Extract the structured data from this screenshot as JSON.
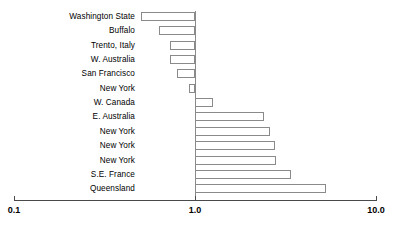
{
  "chart_data": {
    "type": "bar",
    "orientation": "horizontal",
    "title": "",
    "xlabel": "",
    "ylabel": "",
    "xscale": "log",
    "xlim": [
      0.1,
      10.0
    ],
    "grid": false,
    "legend": null,
    "baseline": 1.0,
    "xticks": [
      {
        "value": 0.1,
        "label": "0.1"
      },
      {
        "value": 1.0,
        "label": "1.0"
      },
      {
        "value": 10.0,
        "label": "10.0"
      }
    ],
    "categories": [
      "Washington State",
      "Buffalo",
      "Trento, Italy",
      "W. Australia",
      "San Francisco",
      "New York",
      "W. Canada",
      "E. Australia",
      "New York",
      "New York",
      "New York",
      "S.E. France",
      "Queensland"
    ],
    "values": [
      0.5,
      0.63,
      0.73,
      0.73,
      0.8,
      0.93,
      1.25,
      2.4,
      2.6,
      2.75,
      2.8,
      3.4,
      5.3
    ]
  },
  "style": {
    "bar_fill": "#ffffff",
    "bar_stroke": "#8a8a8a",
    "axis_color": "#4a4a4a",
    "text_color": "#000000",
    "background": "#ffffff"
  }
}
